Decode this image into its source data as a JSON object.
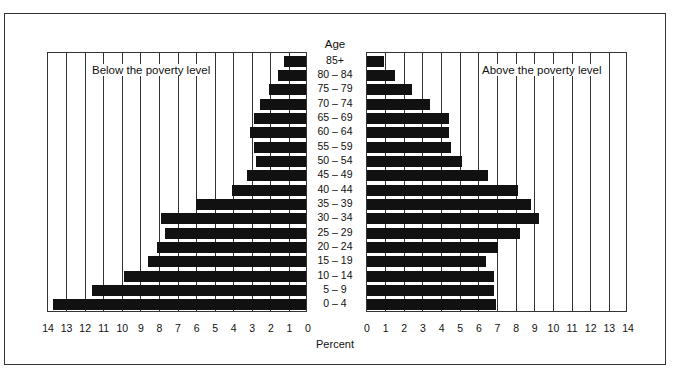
{
  "chart_data": {
    "type": "bar",
    "orientation": "horizontal",
    "subtype": "population-pyramid",
    "title": "",
    "xlabel": "Percent",
    "ylabel": "Age",
    "categories": [
      "85+",
      "80 – 84",
      "75 – 79",
      "70 – 74",
      "65 – 69",
      "60 – 64",
      "55 – 59",
      "50 – 54",
      "45 – 49",
      "40 – 44",
      "35 – 39",
      "30 – 34",
      "25 – 29",
      "20 – 24",
      "15 – 19",
      "10 – 14",
      "5 – 9",
      "0 – 4"
    ],
    "series": [
      {
        "name": "Below the poverty level",
        "side": "left",
        "values": [
          1.2,
          1.5,
          2.0,
          2.5,
          2.8,
          3.0,
          2.8,
          2.7,
          3.2,
          4.0,
          5.9,
          7.8,
          7.6,
          8.0,
          8.5,
          9.8,
          11.5,
          13.6
        ]
      },
      {
        "name": "Above the poverty level",
        "side": "right",
        "values": [
          0.9,
          1.5,
          2.4,
          3.4,
          4.4,
          4.4,
          4.5,
          5.1,
          6.5,
          8.1,
          8.8,
          9.2,
          8.2,
          7.0,
          6.4,
          6.8,
          6.8,
          6.9
        ]
      }
    ],
    "xlim": [
      0,
      14
    ],
    "left_ticks": [
      "14",
      "13",
      "12",
      "11",
      "10",
      "9",
      "8",
      "7",
      "6",
      "5",
      "4",
      "3",
      "2",
      "1",
      "0"
    ],
    "right_ticks": [
      "0",
      "1",
      "2",
      "3",
      "4",
      "5",
      "6",
      "7",
      "8",
      "9",
      "10",
      "11",
      "12",
      "13",
      "14"
    ],
    "grid": true,
    "legend": "in-panel titles"
  },
  "labels": {
    "age_title": "Age",
    "left_title": "Below the poverty level",
    "right_title": "Above the poverty level",
    "xlabel": "Percent"
  },
  "colors": {
    "bar": "#111111",
    "grid": "#333333",
    "background": "#ffffff"
  }
}
